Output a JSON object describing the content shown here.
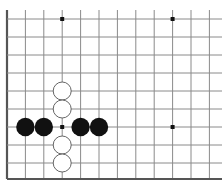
{
  "board": {
    "description": "Go board diagram fragment (lower-left corner region)",
    "colors": {
      "background": "#ffffff",
      "grid_line": "#8a8a8a",
      "edge_line": "#555555",
      "black_stone": "#111111",
      "white_stone_fill": "#ffffff",
      "white_stone_stroke": "#555555",
      "star_point": "#111111"
    },
    "grid": {
      "x": [
        7,
        25.4,
        43.8,
        62.2,
        80.6,
        99,
        117.4,
        135.8,
        154.2,
        172.6,
        191,
        209.4
      ],
      "y": [
        19,
        37,
        55,
        73,
        91,
        109,
        127,
        145,
        163,
        179
      ],
      "left_edge": true,
      "bottom_edge": true,
      "top_extends": true,
      "right_extends": true
    },
    "star_points": [
      {
        "col": 3,
        "row": 0
      },
      {
        "col": 9,
        "row": 0
      },
      {
        "col": 3,
        "row": 6
      },
      {
        "col": 9,
        "row": 6
      }
    ],
    "stones": [
      {
        "color": "black",
        "col": 1,
        "row": 6
      },
      {
        "color": "black",
        "col": 2,
        "row": 6
      },
      {
        "color": "black",
        "col": 4,
        "row": 6
      },
      {
        "color": "black",
        "col": 5,
        "row": 6
      },
      {
        "color": "white",
        "col": 3,
        "row": 4
      },
      {
        "color": "white",
        "col": 3,
        "row": 5
      },
      {
        "color": "white",
        "col": 3,
        "row": 7
      },
      {
        "color": "white",
        "col": 3,
        "row": 8
      }
    ]
  }
}
